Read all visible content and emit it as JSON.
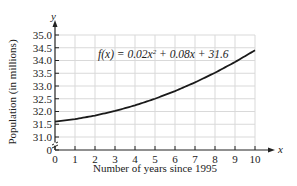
{
  "chart_data": {
    "type": "line",
    "title": "",
    "xlabel": "Number of years since 1995",
    "ylabel": "Population (in millions)",
    "x_axis_symbol": "x",
    "y_axis_symbol": "y",
    "equation_annotation": "f(x) = 0.02x² + 0.08x + 31.6",
    "equation_parts": {
      "prefix": "f(x) = 0.02x",
      "sup": "2",
      "suffix": " + 0.08x + 31.6"
    },
    "x_ticks": [
      "0",
      "1",
      "2",
      "3",
      "4",
      "5",
      "6",
      "7",
      "8",
      "9",
      "10"
    ],
    "y_ticks": [
      "0",
      "31.0",
      "31.5",
      "32.0",
      "32.5",
      "33.0",
      "33.5",
      "34.0",
      "34.5",
      "35.0"
    ],
    "xlim": [
      0,
      10
    ],
    "ylim": [
      31.0,
      35.0
    ],
    "y_axis_break": true,
    "grid": true,
    "legend": "none",
    "x": [
      0,
      1,
      2,
      3,
      4,
      5,
      6,
      7,
      8,
      9,
      10
    ],
    "series": [
      {
        "name": "f(x)",
        "values": [
          31.6,
          31.7,
          31.84,
          32.02,
          32.24,
          32.5,
          32.8,
          33.14,
          33.52,
          33.94,
          34.4
        ]
      }
    ]
  },
  "colors": {
    "curve": "#1a1a1a",
    "grid": "#d9d9d9",
    "axis": "#222222"
  }
}
